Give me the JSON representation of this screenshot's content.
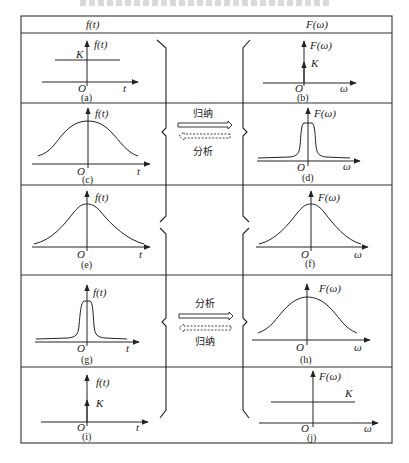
{
  "header": {
    "left": "f(t)",
    "right": "F(ω)"
  },
  "rows": [
    {
      "left": {
        "caption": "(a)",
        "axis_label": "f(t)",
        "x_label": "t",
        "origin": "O",
        "level_label": "K",
        "shape": "constant"
      },
      "right": {
        "caption": "(b)",
        "axis_label": "F(ω)",
        "x_label": "ω",
        "origin": "O",
        "level_label": "K",
        "shape": "impulse"
      }
    },
    {
      "left": {
        "caption": "(c)",
        "axis_label": "f(t)",
        "x_label": "t",
        "origin": "O",
        "shape": "wide-bell"
      },
      "middle": {
        "top_label": "归纳",
        "bottom_label": "分析",
        "solid_arrow": "right",
        "dashed_arrow": "left"
      },
      "right": {
        "caption": "(d)",
        "axis_label": "F(ω)",
        "x_label": "ω",
        "origin": "O",
        "shape": "narrow-peak"
      }
    },
    {
      "left": {
        "caption": "(e)",
        "axis_label": "f(t)",
        "x_label": "t",
        "origin": "O",
        "shape": "medium-bell"
      },
      "right": {
        "caption": "(f)",
        "axis_label": "F(ω)",
        "x_label": "ω",
        "origin": "O",
        "shape": "medium-bell"
      }
    },
    {
      "left": {
        "caption": "(g)",
        "axis_label": "f(t)",
        "x_label": "t",
        "origin": "O",
        "shape": "narrow-peak"
      },
      "middle": {
        "top_label": "分析",
        "bottom_label": "归纳",
        "solid_arrow": "right",
        "dashed_arrow": "left"
      },
      "right": {
        "caption": "(h)",
        "axis_label": "F(ω)",
        "x_label": "ω",
        "origin": "O",
        "shape": "wide-bell"
      }
    },
    {
      "left": {
        "caption": "(i)",
        "axis_label": "f(t)",
        "x_label": "t",
        "origin": "O",
        "level_label": "K",
        "shape": "impulse"
      },
      "right": {
        "caption": "(j)",
        "axis_label": "F(ω)",
        "x_label": "ω",
        "origin": "O",
        "level_label": "K",
        "shape": "constant"
      }
    }
  ],
  "colors": {
    "line": "#222222",
    "border": "#333333",
    "background": "#ffffff"
  }
}
